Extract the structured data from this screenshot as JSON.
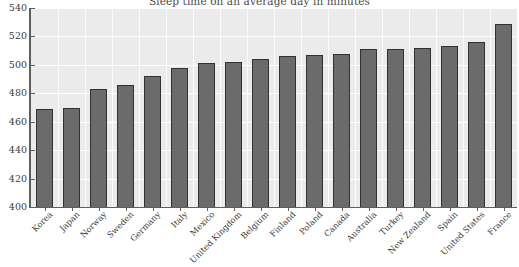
{
  "chart_data": {
    "type": "bar",
    "title": "Sleep time on an average day in minutes",
    "xlabel": "",
    "ylabel": "",
    "ylim": [
      400,
      540
    ],
    "yticks": [
      400,
      420,
      440,
      460,
      480,
      500,
      520,
      540
    ],
    "grid": true,
    "legend": null,
    "bar_color": "#6b6b6b",
    "bar_edge_color": "#313131",
    "plot_background": "#ebebeb",
    "gridline_color": "#ffffff",
    "categories": [
      "Korea",
      "Japan",
      "Norway",
      "Sweden",
      "Germany",
      "Italy",
      "Mexico",
      "United Kingdom",
      "Belgium",
      "Finland",
      "Poland",
      "Canada",
      "Australia",
      "Turkey",
      "New Zealand",
      "Spain",
      "United States",
      "France"
    ],
    "values": [
      469,
      470,
      483,
      486,
      492,
      498,
      501,
      502,
      504,
      506,
      507,
      508,
      511,
      511,
      512,
      513,
      516,
      529
    ]
  }
}
